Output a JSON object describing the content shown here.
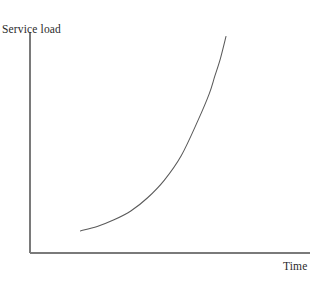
{
  "figure": {
    "background_color": "#ffffff",
    "width": 322,
    "height": 283
  },
  "chart_data": {
    "type": "line",
    "title": "",
    "subtitle": "",
    "xlabel": "Time",
    "ylabel": "Service load",
    "grid": false,
    "legend": null,
    "axis_color": "#7a7a7a",
    "curve_color": "#5a5a5a",
    "xlim": [
      0,
      1
    ],
    "ylim": [
      0,
      1
    ],
    "xticks": [],
    "yticks": [],
    "xticklabels": [],
    "yticklabels": [],
    "annotations": [],
    "series": [
      {
        "name": "Service load over time",
        "x": [
          0.18,
          0.24,
          0.3,
          0.36,
          0.42,
          0.48,
          0.54,
          0.6,
          0.64,
          0.66,
          0.68,
          0.7
        ],
        "y": [
          0.1,
          0.12,
          0.15,
          0.19,
          0.25,
          0.33,
          0.44,
          0.6,
          0.72,
          0.8,
          0.88,
          0.98
        ]
      }
    ]
  },
  "labels": {
    "y_axis": "Service load",
    "x_axis": "Time"
  }
}
